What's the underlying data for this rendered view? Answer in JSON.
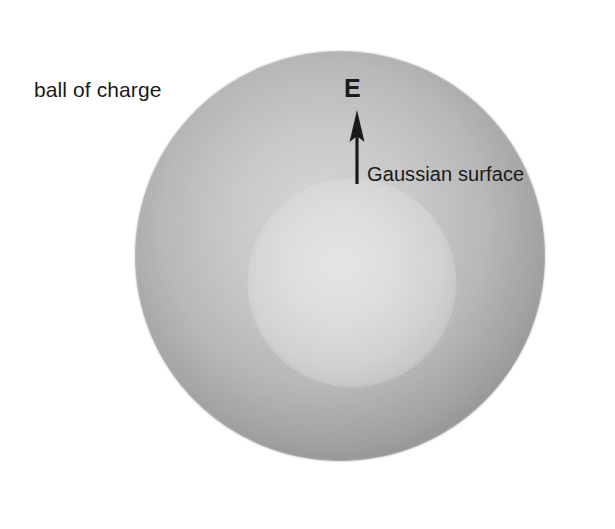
{
  "figure": {
    "canvas": {
      "width": 615,
      "height": 529,
      "background": "#ffffff"
    },
    "labels": {
      "ball_of_charge": "ball of charge",
      "gaussian_surface": "Gaussian surface",
      "field_vector": "E"
    },
    "shapes": {
      "outer_sphere": {
        "name": "ball of charge",
        "center_x": 340,
        "center_y": 256,
        "radius": 205,
        "fill_center_color": "#e2e2e2",
        "fill_edge_color": "#9c9c9c"
      },
      "inner_sphere": {
        "name": "Gaussian surface",
        "center_x": 352,
        "center_y": 283,
        "radius": 103,
        "fill_center_color": "#ebebeb",
        "fill_edge_color": "#c9c9c9"
      }
    },
    "arrow": {
      "name": "electric field vector",
      "x": 357,
      "tail_y": 183,
      "head_y": 112,
      "color": "#1a1a1a",
      "shaft_width": 3,
      "head_width": 15,
      "head_length": 30
    }
  }
}
